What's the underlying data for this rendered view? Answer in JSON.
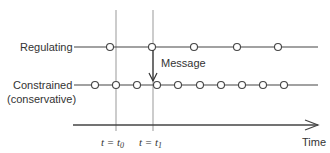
{
  "diagram": {
    "labels": {
      "regulating": "Regulating",
      "constrained_line1": "Constrained",
      "constrained_line2": "(conservative)",
      "message": "Message",
      "time": "Time",
      "t0_prefix": "t = t",
      "t0_sub": "0",
      "t1_prefix": "t = t",
      "t1_sub": "1"
    },
    "regulating_events_x": [
      110,
      152,
      194,
      237,
      278
    ],
    "constrained_events_x": [
      95,
      116,
      137,
      157,
      178,
      200,
      221,
      242,
      263,
      284
    ],
    "markers_x": {
      "t0": 116,
      "t1": 153
    },
    "colors": {
      "line": "#444444",
      "marker": "#888888",
      "text": "#333333"
    }
  }
}
